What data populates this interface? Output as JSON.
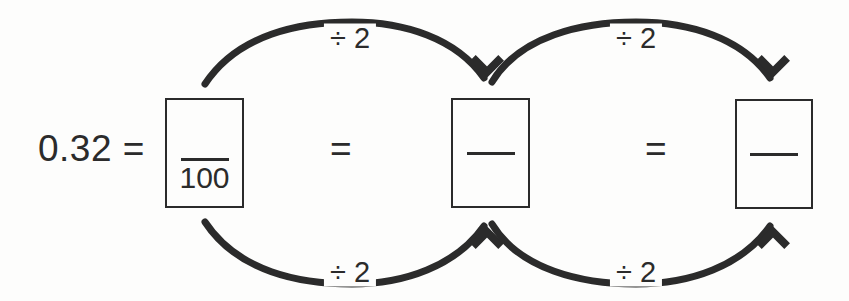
{
  "diagram": {
    "ink_color": "#2b2b2b",
    "background_color": "#fdfdfc",
    "lead_expression": "0.32 =",
    "equals_1": "=",
    "equals_2": "=",
    "boxes": [
      {
        "id": "box-1",
        "numerator": "",
        "denominator": "100",
        "filled": true
      },
      {
        "id": "box-2",
        "numerator": "",
        "denominator": "",
        "filled": false
      },
      {
        "id": "box-3",
        "numerator": "",
        "denominator": "",
        "filled": false
      }
    ],
    "arrows": [
      {
        "id": "arrow-top-1",
        "label": "÷ 2",
        "direction": "box-1-numerator-to-box-2-numerator",
        "position": "top"
      },
      {
        "id": "arrow-top-2",
        "label": "÷ 2",
        "direction": "box-2-numerator-to-box-3-numerator",
        "position": "top"
      },
      {
        "id": "arrow-bottom-1",
        "label": "÷ 2",
        "direction": "box-1-denominator-to-box-2-denominator",
        "position": "bottom"
      },
      {
        "id": "arrow-bottom-2",
        "label": "÷ 2",
        "direction": "box-2-denominator-to-box-3-denominator",
        "position": "bottom"
      }
    ]
  }
}
